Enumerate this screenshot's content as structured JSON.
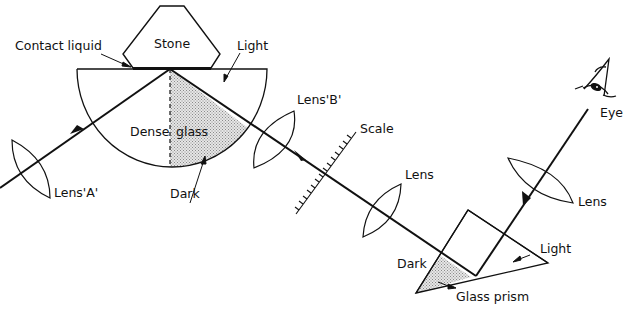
{
  "diagram": {
    "labels": {
      "stone": "Stone",
      "contact_liquid": "Contact liquid",
      "light_top": "Light",
      "dense_glass_1": "Dense",
      "dense_glass_2": "glass",
      "dark_top": "Dark",
      "lens_a": "Lens'A'",
      "lens_b": "Lens'B'",
      "scale": "Scale",
      "lens_mid": "Lens",
      "lens_eye": "Lens",
      "eye": "Eye",
      "dark_prism": "Dark",
      "light_prism": "Light",
      "glass_prism": "Glass prism"
    },
    "colors": {
      "line": "#111111",
      "shade": "#cfcfcf",
      "background": "#ffffff"
    }
  }
}
